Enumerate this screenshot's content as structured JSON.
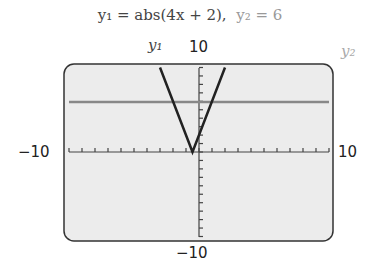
{
  "title": {
    "y1": "y₁ = abs(4x + 2),",
    "y2": "y₂ = 6"
  },
  "labels": {
    "y1": "y₁",
    "y2": "y₂",
    "ymax": "10",
    "ymin": "−10",
    "xmin": "−10",
    "xmax": "10"
  },
  "chart_data": {
    "type": "line",
    "xlim": [
      -10,
      10
    ],
    "ylim": [
      -10,
      10
    ],
    "xscale": 1,
    "yscale": 1,
    "series": [
      {
        "name": "y1",
        "expr": "abs(4x + 2)",
        "x": [
          -3,
          -0.5,
          2
        ],
        "y": [
          10,
          0,
          10
        ],
        "color": "#222222"
      },
      {
        "name": "y2",
        "expr": "6",
        "x": [
          -10,
          10
        ],
        "y": [
          6,
          6
        ],
        "color": "#888888"
      }
    ],
    "screen_bg": "#ececec"
  }
}
